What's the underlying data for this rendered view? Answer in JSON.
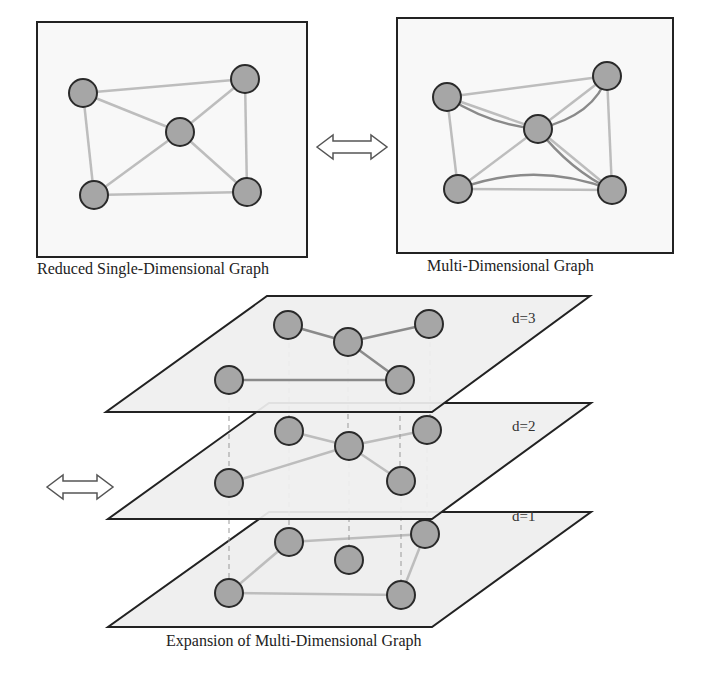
{
  "captions": {
    "single": "Reduced Single-Dimensional Graph",
    "multi": "Multi-Dimensional Graph",
    "expansion": "Expansion of Multi-Dimensional Graph"
  },
  "layers": [
    {
      "label": "d=3"
    },
    {
      "label": "d=2"
    },
    {
      "label": "d=1"
    }
  ],
  "icons": {
    "top_arrow": "double-arrow-icon",
    "left_arrow": "double-arrow-icon"
  },
  "colors": {
    "node_fill": "#a6a6a6",
    "node_stroke": "#2a2a2a",
    "edge_light": "#bdbdbd",
    "edge_dark": "#8a8a8a",
    "plane_fill": "#f0f0f0",
    "frame": "#222222"
  }
}
